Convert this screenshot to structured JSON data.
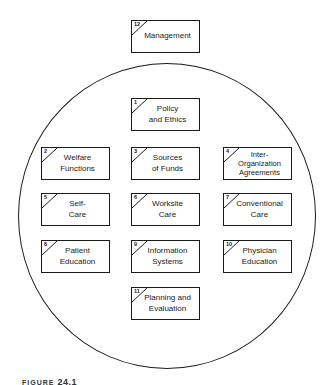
{
  "diagram": {
    "outer_box": {
      "number": "12",
      "label": "Management"
    },
    "boxes": [
      {
        "number": "1",
        "label": "Policy\nand Ethics"
      },
      {
        "number": "2",
        "label": "Welfare\nFunctions"
      },
      {
        "number": "3",
        "label": "Sources\nof Funds"
      },
      {
        "number": "4",
        "label": "Inter-\nOrganization\nAgreements"
      },
      {
        "number": "5",
        "label": "Self-\nCare"
      },
      {
        "number": "6",
        "label": "Worksite\nCare"
      },
      {
        "number": "7",
        "label": "Conventional\nCare"
      },
      {
        "number": "8",
        "label": "Patient\nEducation"
      },
      {
        "number": "9",
        "label": "Information\nSystems"
      },
      {
        "number": "10",
        "label": "Physician\nEducation"
      },
      {
        "number": "11",
        "label": "Planning and\nEvaluation"
      }
    ]
  },
  "caption": {
    "prefix": "FIGURE",
    "number": "24.1"
  }
}
